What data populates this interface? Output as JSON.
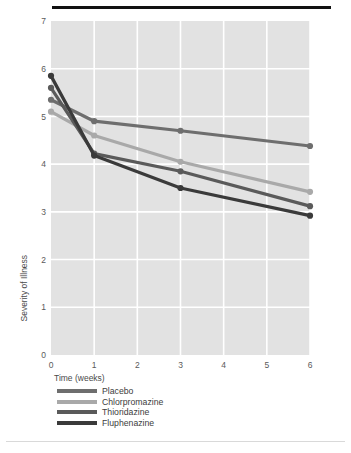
{
  "chart_data": {
    "type": "line",
    "title": "",
    "xlabel": "Time (weeks)",
    "ylabel": "Severity of Illness",
    "x": [
      0,
      1,
      3,
      6
    ],
    "xticks": [
      "0",
      "1",
      "2",
      "3",
      "4",
      "5",
      "6"
    ],
    "yticks": [
      "0",
      "1",
      "2",
      "3",
      "4",
      "5",
      "6",
      "7"
    ],
    "xlim": [
      0,
      6
    ],
    "ylim": [
      0,
      7
    ],
    "grid": true,
    "legend_position": "bottom-left",
    "series": [
      {
        "name": "Placebo",
        "color": "#6e6e6e",
        "values": [
          5.35,
          4.9,
          4.7,
          4.38
        ]
      },
      {
        "name": "Chlorpromazine",
        "color": "#a9a9a9",
        "values": [
          5.1,
          4.6,
          4.05,
          3.42
        ]
      },
      {
        "name": "Thioridazine",
        "color": "#5a5a5a",
        "values": [
          5.6,
          4.22,
          3.85,
          3.12
        ]
      },
      {
        "name": "Fluphenazine",
        "color": "#3a3a3a",
        "values": [
          5.85,
          4.18,
          3.5,
          2.92
        ]
      }
    ],
    "panel_bg": "#e2e2e2",
    "grid_color": "#ffffff",
    "rule_color": "#111111"
  }
}
